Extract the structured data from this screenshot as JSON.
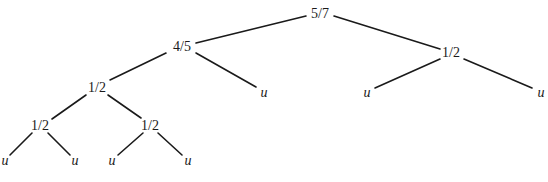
{
  "diagram": {
    "type": "tree",
    "colors": {
      "line": "#1a1a1a",
      "text": "#1a1a1a",
      "background": "#ffffff"
    },
    "nodes": [
      {
        "id": "root",
        "label": "5/7",
        "x": 320,
        "y": 14,
        "leaf": false
      },
      {
        "id": "n1",
        "label": "4/5",
        "x": 182,
        "y": 47,
        "leaf": false
      },
      {
        "id": "n2",
        "label": "1/2",
        "x": 451,
        "y": 53,
        "leaf": false
      },
      {
        "id": "n3",
        "label": "1/2",
        "x": 97,
        "y": 88,
        "leaf": false
      },
      {
        "id": "u1",
        "label": "u",
        "x": 264,
        "y": 93,
        "leaf": true
      },
      {
        "id": "u2",
        "label": "u",
        "x": 367,
        "y": 93,
        "leaf": true
      },
      {
        "id": "u3",
        "label": "u",
        "x": 541,
        "y": 93,
        "leaf": true
      },
      {
        "id": "n4",
        "label": "1/2",
        "x": 40,
        "y": 126,
        "leaf": false
      },
      {
        "id": "n5",
        "label": "1/2",
        "x": 150,
        "y": 126,
        "leaf": false
      },
      {
        "id": "u4",
        "label": "u",
        "x": 5,
        "y": 161,
        "leaf": true
      },
      {
        "id": "u5",
        "label": "u",
        "x": 75,
        "y": 161,
        "leaf": true
      },
      {
        "id": "u6",
        "label": "u",
        "x": 112,
        "y": 161,
        "leaf": true
      },
      {
        "id": "u7",
        "label": "u",
        "x": 188,
        "y": 161,
        "leaf": true
      }
    ],
    "edges": [
      {
        "from": "root",
        "to": "n1",
        "x1": 306,
        "y1": 16,
        "x2": 196,
        "y2": 43
      },
      {
        "from": "root",
        "to": "n2",
        "x1": 334,
        "y1": 16,
        "x2": 440,
        "y2": 49
      },
      {
        "from": "n1",
        "to": "n3",
        "x1": 166,
        "y1": 53,
        "x2": 110,
        "y2": 80
      },
      {
        "from": "n1",
        "to": "u1",
        "x1": 196,
        "y1": 53,
        "x2": 256,
        "y2": 87
      },
      {
        "from": "n2",
        "to": "u2",
        "x1": 440,
        "y1": 59,
        "x2": 375,
        "y2": 88
      },
      {
        "from": "n2",
        "to": "u3",
        "x1": 464,
        "y1": 59,
        "x2": 532,
        "y2": 88
      },
      {
        "from": "n3",
        "to": "n4",
        "x1": 86,
        "y1": 95,
        "x2": 52,
        "y2": 119
      },
      {
        "from": "n3",
        "to": "n5",
        "x1": 108,
        "y1": 95,
        "x2": 141,
        "y2": 118
      },
      {
        "from": "n4",
        "to": "u4",
        "x1": 32,
        "y1": 133,
        "x2": 10,
        "y2": 155
      },
      {
        "from": "n4",
        "to": "u5",
        "x1": 48,
        "y1": 133,
        "x2": 70,
        "y2": 155
      },
      {
        "from": "n5",
        "to": "u6",
        "x1": 143,
        "y1": 133,
        "x2": 118,
        "y2": 155
      },
      {
        "from": "n5",
        "to": "u7",
        "x1": 158,
        "y1": 133,
        "x2": 182,
        "y2": 155
      }
    ]
  }
}
